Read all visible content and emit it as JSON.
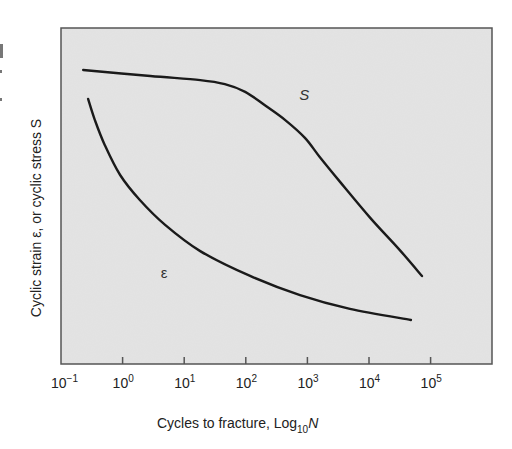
{
  "chart_data": {
    "type": "line",
    "title": "",
    "xlabel": "Cycles to fracture, Log",
    "xlabel_sub": "10",
    "xlabel_var": "N",
    "ylabel": "Cyclic strain ε, or cyclic stress S",
    "x_scale": "log10",
    "xlim_log10": [
      -1,
      6
    ],
    "ylim_relative": [
      0,
      1
    ],
    "y_ticks": "none",
    "grid": false,
    "legend": "none (curves labeled inline)",
    "x_ticks": [
      {
        "exp": 0,
        "base": "10",
        "sup": "0"
      },
      {
        "exp": 1,
        "base": "10",
        "sup": "1"
      },
      {
        "exp": 2,
        "base": "10",
        "sup": "2"
      },
      {
        "exp": 3,
        "base": "10",
        "sup": "3"
      },
      {
        "exp": 4,
        "base": "10",
        "sup": "4"
      },
      {
        "exp": 5,
        "base": "10",
        "sup": "5"
      }
    ],
    "x_tick_labels": [
      {
        "exp": -1,
        "base": "10",
        "sup": "−1"
      },
      {
        "exp": 0,
        "base": "10",
        "sup": "0"
      },
      {
        "exp": 1,
        "base": "10",
        "sup": "1"
      },
      {
        "exp": 2,
        "base": "10",
        "sup": "2"
      },
      {
        "exp": 3,
        "base": "10",
        "sup": "3"
      },
      {
        "exp": 4,
        "base": "10",
        "sup": "4"
      },
      {
        "exp": 5,
        "base": "10",
        "sup": "5"
      }
    ],
    "series": [
      {
        "name": "S",
        "label": "S",
        "description": "cyclic stress",
        "label_at": {
          "log10N": 2.95,
          "rel": 0.8
        },
        "points": [
          [
            -0.64,
            0.875
          ],
          [
            0.45,
            0.857
          ],
          [
            1.26,
            0.845
          ],
          [
            1.66,
            0.833
          ],
          [
            1.99,
            0.81
          ],
          [
            2.31,
            0.77
          ],
          [
            2.64,
            0.726
          ],
          [
            2.96,
            0.673
          ],
          [
            3.2,
            0.616
          ],
          [
            3.53,
            0.542
          ],
          [
            4.02,
            0.435
          ],
          [
            4.5,
            0.339
          ],
          [
            4.86,
            0.262
          ]
        ]
      },
      {
        "name": "epsilon",
        "label": "ε",
        "description": "cyclic strain",
        "label_at": {
          "log10N": 0.7,
          "rel": 0.27
        },
        "points": [
          [
            -0.56,
            0.789
          ],
          [
            -0.45,
            0.726
          ],
          [
            -0.29,
            0.652
          ],
          [
            -0.04,
            0.5625
          ],
          [
            0.28,
            0.488
          ],
          [
            0.69,
            0.414
          ],
          [
            1.26,
            0.336
          ],
          [
            2.07,
            0.262
          ],
          [
            2.88,
            0.205
          ],
          [
            3.69,
            0.164
          ],
          [
            4.68,
            0.131
          ]
        ]
      }
    ],
    "colors": {
      "plot_background": "#e4e4e4",
      "frame": "#555555",
      "curve": "#1a1a1a"
    }
  }
}
